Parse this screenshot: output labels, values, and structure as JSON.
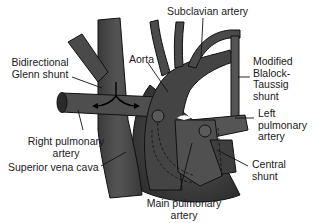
{
  "figure": {
    "colors": {
      "vessel_fill": "#4a4a4a",
      "vessel_dark": "#2e2e2e",
      "vessel_light": "#6a6a6a",
      "outline": "#111111",
      "background": "#ffffff",
      "label_text": "#1a1a1a"
    },
    "labels": {
      "subclavian_artery": "Subclavian artery",
      "aorta": "Aorta",
      "bidirectional_glenn_line1": "Bidirectional",
      "bidirectional_glenn_line2": "Glenn shunt",
      "modified_bt_line1": "Modified",
      "modified_bt_line2": "Blalock-",
      "modified_bt_line3": "Taussig",
      "modified_bt_line4": "shunt",
      "left_pa_line1": "Left",
      "left_pa_line2": "pulmonary",
      "left_pa_line3": "artery",
      "right_pa_line1": "Right pulmonary",
      "right_pa_line2": "artery",
      "svc": "Superior vena cava",
      "central_shunt_line1": "Central",
      "central_shunt_line2": "shunt",
      "main_pa_line1": "Main pulmonary",
      "main_pa_line2": "artery"
    }
  }
}
